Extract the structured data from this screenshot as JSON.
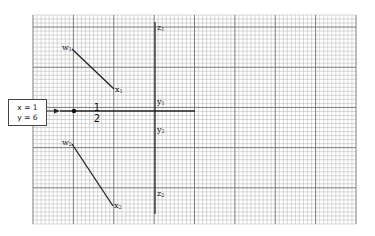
{
  "diagram": {
    "type": "graph-paper schematic",
    "grid": {
      "left": 33,
      "top": 15,
      "right": 356,
      "bottom": 224,
      "minor_spacing": 4.04,
      "major_every": 10
    },
    "input_box": {
      "line1": "x = 1",
      "line2": "y = 6"
    },
    "fraction": {
      "numerator": "1",
      "denominator": "2"
    },
    "labels": {
      "w1": "w",
      "w1_sub": "1",
      "x1": "x",
      "x1_sub": "1",
      "w2": "w",
      "w2_sub": "2",
      "x2": "x",
      "x2_sub": "2",
      "z1": "z",
      "z1_sub": "1",
      "z2": "z",
      "z2_sub": "2",
      "y1": "y",
      "y1_sub": "1",
      "y2": "y",
      "y2_sub": "2"
    },
    "lines": [
      {
        "name": "w1-x1",
        "from": [
          72,
          49
        ],
        "to": [
          114,
          89
        ]
      },
      {
        "name": "w2-x2",
        "from": [
          72,
          144
        ],
        "to": [
          113,
          206
        ]
      },
      {
        "name": "z-axis",
        "from": [
          155,
          22
        ],
        "to": [
          155,
          214
        ]
      },
      {
        "name": "input-line",
        "from": [
          60,
          111
        ],
        "to": [
          195,
          111
        ]
      }
    ],
    "colors": {
      "minor_grid": "#b8b8b8",
      "major_grid": "#6a6a6a",
      "ink": "#222222"
    }
  }
}
